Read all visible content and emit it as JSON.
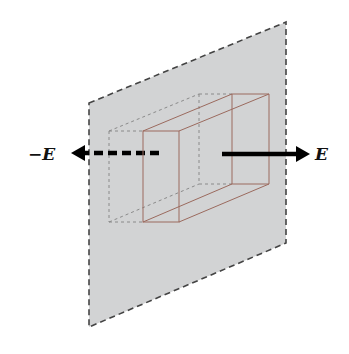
{
  "diagram": {
    "title": "",
    "labels": {
      "field_positive": "E",
      "field_negative": "−E"
    },
    "colors": {
      "plane_fill": "#d2d3d4",
      "plane_edge": "#444444",
      "box_edge": "#9b6a5e",
      "box_hidden_edge": "#8a8a8a",
      "arrow": "#000000",
      "background": "#ffffff"
    },
    "elements": [
      {
        "id": "charged-plane",
        "type": "dashed-parallelogram",
        "description": "infinite plane of charge shown edge-dashed"
      },
      {
        "id": "gaussian-box",
        "type": "rectangular-box",
        "description": "Gaussian pillbox straddling the plane"
      },
      {
        "id": "arrow-right",
        "type": "solid-arrow",
        "label_ref": "field_positive"
      },
      {
        "id": "arrow-left",
        "type": "dashed-arrow",
        "label_ref": "field_negative"
      }
    ]
  }
}
